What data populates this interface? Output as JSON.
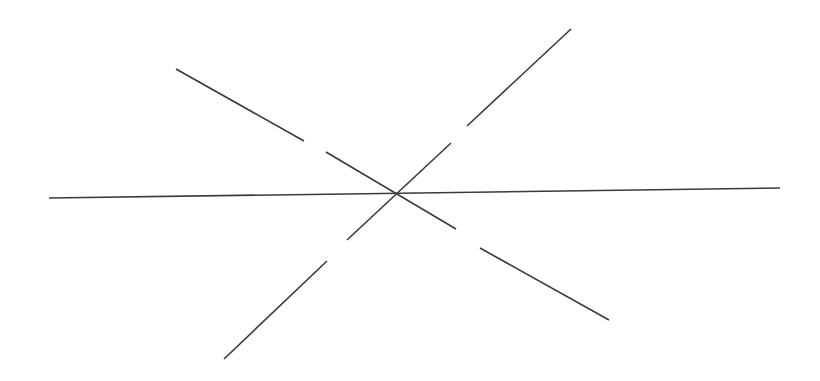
{
  "diagram": {
    "title": "",
    "background": "#ffffff",
    "stroke_color": "#3a3a3a",
    "stroke_width": 1.6,
    "intersection": {
      "x": 395,
      "y": 194
    },
    "lines": [
      {
        "name": "horizontal-line",
        "segments": [
          {
            "x1": 49,
            "y1": 198,
            "x2": 780,
            "y2": 188
          }
        ]
      },
      {
        "name": "rising-diagonal-line",
        "segments": [
          {
            "x1": 467,
            "y1": 126,
            "x2": 571,
            "y2": 29
          },
          {
            "x1": 451,
            "y1": 143,
            "x2": 347,
            "y2": 240
          },
          {
            "x1": 327,
            "y1": 261,
            "x2": 224,
            "y2": 359
          }
        ]
      },
      {
        "name": "falling-diagonal-line",
        "segments": [
          {
            "x1": 176,
            "y1": 69,
            "x2": 304,
            "y2": 141
          },
          {
            "x1": 326,
            "y1": 152,
            "x2": 456,
            "y2": 229
          },
          {
            "x1": 480,
            "y1": 248,
            "x2": 609,
            "y2": 320
          }
        ]
      }
    ]
  }
}
